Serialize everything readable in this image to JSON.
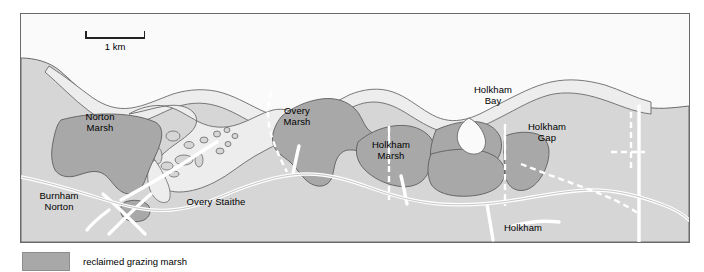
{
  "figure": {
    "type": "map",
    "scalebar": {
      "label": "1 km"
    },
    "legend": {
      "swatch_color": "#a8a8a8",
      "label": "reclaimed grazing marsh"
    },
    "colors": {
      "sea": "#fafafa",
      "land": "#d6d6d6",
      "saltmarsh": "#ededed",
      "reclaimed_marsh": "#a8a8a8",
      "road": "#ffffff",
      "outline": "#6a6a6a",
      "text": "#000000"
    },
    "labels": [
      {
        "name": "norton-marsh",
        "text": "Norton\nMarsh",
        "x": 100,
        "y": 117
      },
      {
        "name": "overy-marsh",
        "text": "Overy\nMarsh",
        "x": 297,
        "y": 111
      },
      {
        "name": "holkham-marsh",
        "text": "Holkham\nMarsh",
        "x": 390,
        "y": 145
      },
      {
        "name": "holkham-bay",
        "text": "Holkham\nBay",
        "x": 493,
        "y": 90
      },
      {
        "name": "holkham-gap",
        "text": "Holkham\nGap",
        "x": 546,
        "y": 128
      },
      {
        "name": "burnham-norton",
        "text": "Burnham\nNorton",
        "x": 59,
        "y": 196
      },
      {
        "name": "overy-staithe",
        "text": "Overy Staithe",
        "x": 216,
        "y": 202
      },
      {
        "name": "holkham",
        "text": "Holkham",
        "x": 523,
        "y": 228
      }
    ]
  }
}
